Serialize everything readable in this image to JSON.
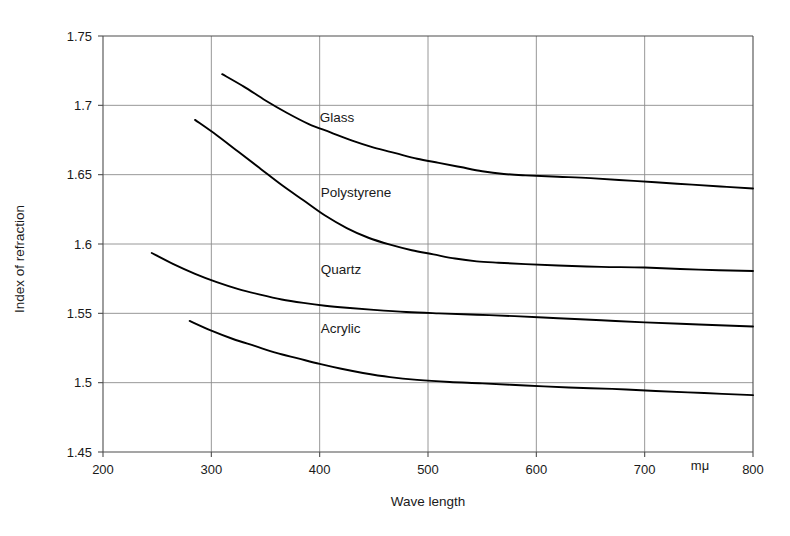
{
  "chart_data": {
    "type": "line",
    "title": "",
    "subtitle": "",
    "xlabel": "Wave length",
    "ylabel": "Index of refraction",
    "xunit": "mμ",
    "xlim": [
      200,
      800
    ],
    "ylim": [
      1.45,
      1.75
    ],
    "grid": true,
    "legend_position": "inline-labels",
    "xticks": [
      200,
      300,
      400,
      500,
      600,
      700,
      800
    ],
    "xtick_labels": [
      "200",
      "300",
      "400",
      "500",
      "600",
      "700",
      "800"
    ],
    "yticks": [
      1.45,
      1.5,
      1.55,
      1.6,
      1.65,
      1.7,
      1.75
    ],
    "ytick_labels": [
      "1.45",
      "1.5",
      "1.55",
      "1.6",
      "1.65",
      "1.7",
      "1.75"
    ],
    "series": [
      {
        "name": "Glass",
        "label_x": 400,
        "label_y": 1.688,
        "x": [
          310,
          330,
          350,
          370,
          390,
          410,
          430,
          450,
          470,
          490,
          510,
          530,
          550,
          570,
          590,
          620,
          650,
          690,
          730,
          770,
          800
        ],
        "y": [
          1.7225,
          1.7135,
          1.7035,
          1.6945,
          1.6865,
          1.6805,
          1.6745,
          1.6695,
          1.6655,
          1.6615,
          1.6585,
          1.6555,
          1.6525,
          1.6505,
          1.6495,
          1.6485,
          1.6475,
          1.6455,
          1.6435,
          1.6415,
          1.64
        ]
      },
      {
        "name": "Polystyrene",
        "label_x": 401,
        "label_y": 1.634,
        "x": [
          285,
          305,
          325,
          345,
          365,
          385,
          405,
          425,
          445,
          465,
          485,
          505,
          525,
          545,
          565,
          590,
          620,
          660,
          700,
          750,
          800
        ],
        "y": [
          1.6895,
          1.6785,
          1.6665,
          1.6545,
          1.6425,
          1.6315,
          1.6205,
          1.6115,
          1.6045,
          1.5995,
          1.5955,
          1.5925,
          1.5895,
          1.5875,
          1.5865,
          1.5855,
          1.5845,
          1.5835,
          1.583,
          1.5815,
          1.5805
        ]
      },
      {
        "name": "Quartz",
        "label_x": 401,
        "label_y": 1.5785,
        "x": [
          245,
          265,
          285,
          305,
          325,
          345,
          365,
          385,
          405,
          425,
          450,
          480,
          510,
          545,
          580,
          620,
          660,
          700,
          750,
          800
        ],
        "y": [
          1.5935,
          1.5855,
          1.5785,
          1.5725,
          1.5675,
          1.5635,
          1.56,
          1.5575,
          1.5555,
          1.554,
          1.5525,
          1.551,
          1.55,
          1.549,
          1.548,
          1.5465,
          1.545,
          1.5435,
          1.542,
          1.5405
        ]
      },
      {
        "name": "Acrylic",
        "label_x": 401,
        "label_y": 1.5355,
        "x": [
          280,
          300,
          320,
          340,
          360,
          380,
          400,
          420,
          440,
          465,
          490,
          520,
          550,
          590,
          630,
          670,
          710,
          755,
          800
        ],
        "y": [
          1.5445,
          1.5375,
          1.5315,
          1.5265,
          1.5215,
          1.5175,
          1.5135,
          1.51,
          1.507,
          1.504,
          1.502,
          1.5005,
          1.4995,
          1.498,
          1.4965,
          1.4955,
          1.494,
          1.4925,
          1.491
        ]
      }
    ]
  },
  "colors": {
    "curve": "#000000",
    "grid": "#8c8c8c",
    "axis": "#4d4d4d",
    "text": "#1a1a1a",
    "background": "#ffffff"
  }
}
